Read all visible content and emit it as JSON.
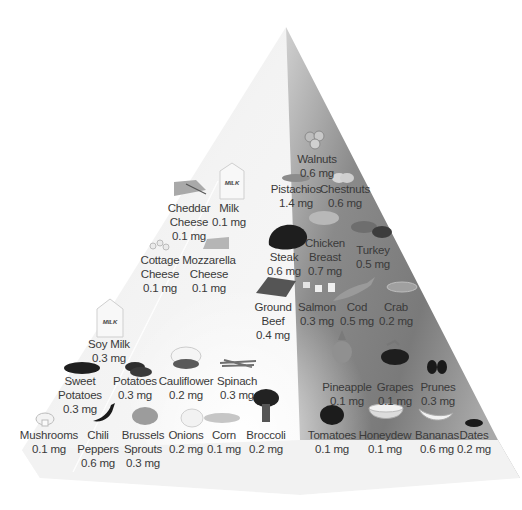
{
  "diagram": {
    "type": "food-pyramid",
    "nutrient_unit": "mg",
    "colors": {
      "background": "#ffffff",
      "left_face_light": "#f4f4f4",
      "left_face_mid": "#d8d8d8",
      "right_face_dark": "#7a7a7a",
      "right_face_light": "#bdbdbd",
      "text": "#3a3a3a"
    }
  },
  "groups": {
    "nuts": [
      {
        "name": "Walnuts",
        "value": "0.6 mg",
        "icon": "walnut-icon"
      },
      {
        "name": "Pistachios",
        "value": "1.4 mg",
        "icon": "pistachio-icon"
      },
      {
        "name": "Chestnuts",
        "value": "0.6 mg",
        "icon": "chestnut-icon"
      }
    ],
    "dairy": [
      {
        "name": "Cheddar Cheese",
        "lines": [
          "Cheddar",
          "Cheese"
        ],
        "value": "0.1 mg",
        "icon": "cheese-wedge-icon"
      },
      {
        "name": "Milk",
        "lines": [
          "Milk"
        ],
        "value": "0.1 mg",
        "icon": "milk-carton-icon",
        "carton_text": "MILK"
      },
      {
        "name": "Cottage Cheese",
        "lines": [
          "Cottage",
          "Cheese"
        ],
        "value": "0.1 mg",
        "icon": "cottage-cheese-icon"
      },
      {
        "name": "Mozzarella Cheese",
        "lines": [
          "Mozzarella",
          "Cheese"
        ],
        "value": "0.1 mg",
        "icon": "cheese-block-icon"
      },
      {
        "name": "Soy Milk",
        "lines": [
          "Soy Milk"
        ],
        "value": "0.3 mg",
        "icon": "milk-carton-icon",
        "carton_text": "MILK"
      }
    ],
    "protein": [
      {
        "name": "Steak",
        "lines": [
          "Steak"
        ],
        "value": "0.6 mg",
        "icon": "steak-icon"
      },
      {
        "name": "Chicken Breast",
        "lines": [
          "Chicken",
          "Breast"
        ],
        "value": "0.7 mg",
        "icon": "chicken-icon"
      },
      {
        "name": "Turkey",
        "lines": [
          "Turkey"
        ],
        "value": "0.5 mg",
        "icon": "turkey-icon"
      },
      {
        "name": "Ground Beef",
        "lines": [
          "Ground",
          "Beef"
        ],
        "value": "0.4 mg",
        "icon": "ground-beef-icon"
      },
      {
        "name": "Salmon",
        "lines": [
          "Salmon"
        ],
        "value": "0.3 mg",
        "icon": "salmon-icon"
      },
      {
        "name": "Cod",
        "lines": [
          "Cod"
        ],
        "value": "0.5 mg",
        "icon": "fish-icon"
      },
      {
        "name": "Crab",
        "lines": [
          "Crab"
        ],
        "value": "0.2 mg",
        "icon": "crab-icon"
      }
    ],
    "vegetables": [
      {
        "name": "Sweet Potatoes",
        "lines": [
          "Sweet",
          "Potatoes"
        ],
        "value": "0.3 mg",
        "icon": "sweet-potato-icon"
      },
      {
        "name": "Potatoes",
        "lines": [
          "Potatoes"
        ],
        "value": "0.3 mg",
        "icon": "potato-icon"
      },
      {
        "name": "Cauliflower",
        "lines": [
          "Cauliflower"
        ],
        "value": "0.2 mg",
        "icon": "cauliflower-icon"
      },
      {
        "name": "Spinach",
        "lines": [
          "Spinach"
        ],
        "value": "0.3 mg",
        "icon": "spinach-icon"
      },
      {
        "name": "Mushrooms",
        "lines": [
          "Mushrooms"
        ],
        "value": "0.1 mg",
        "icon": "mushroom-icon"
      },
      {
        "name": "Chili Peppers",
        "lines": [
          "Chili",
          "Peppers"
        ],
        "value": "0.6 mg",
        "icon": "chili-pepper-icon"
      },
      {
        "name": "Brussels Sprouts",
        "lines": [
          "Brussels",
          "Sprouts"
        ],
        "value": "0.3 mg",
        "icon": "brussels-sprouts-icon"
      },
      {
        "name": "Onions",
        "lines": [
          "Onions"
        ],
        "value": "0.2 mg",
        "icon": "onion-icon"
      },
      {
        "name": "Corn",
        "lines": [
          "Corn"
        ],
        "value": "0.1 mg",
        "icon": "corn-icon"
      },
      {
        "name": "Broccoli",
        "lines": [
          "Broccoli"
        ],
        "value": "0.2 mg",
        "icon": "broccoli-icon"
      }
    ],
    "fruits": [
      {
        "name": "Pineapple",
        "lines": [
          "Pineapple"
        ],
        "value": "0.1 mg",
        "icon": "pineapple-icon"
      },
      {
        "name": "Grapes",
        "lines": [
          "Grapes"
        ],
        "value": "0.1 mg",
        "icon": "grapes-icon"
      },
      {
        "name": "Prunes",
        "lines": [
          "Prunes"
        ],
        "value": "0.3 mg",
        "icon": "prunes-icon"
      },
      {
        "name": "Tomatoes",
        "lines": [
          "Tomatoes"
        ],
        "value": "0.1 mg",
        "icon": "tomato-icon"
      },
      {
        "name": "Honeydew",
        "lines": [
          "Honeydew"
        ],
        "value": "0.1 mg",
        "icon": "honeydew-icon"
      },
      {
        "name": "Bananas",
        "lines": [
          "Bananas"
        ],
        "value": "0.6 mg",
        "icon": "banana-icon"
      },
      {
        "name": "Dates",
        "lines": [
          "Dates"
        ],
        "value": "0.2 mg",
        "icon": "dates-icon"
      }
    ]
  }
}
